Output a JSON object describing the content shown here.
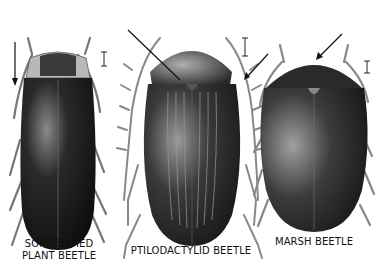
{
  "figure": {
    "background": "#ffffff",
    "ink_color": "#111111",
    "beetles": [
      {
        "id": "soft-bodied-plant-beetle",
        "label_line1": "SOFT-BODIED",
        "label_line2": "PLANT BEETLE",
        "scale_bar": "I",
        "arrow_pointing_to": "pronotum side"
      },
      {
        "id": "ptilodactylid-beetle",
        "label_line1": "PTILODACTYLID BEETLE",
        "scale_bar": "I",
        "arrow_pointing_to": "scutellum / antenna"
      },
      {
        "id": "marsh-beetle",
        "label_line1": "MARSH BEETLE",
        "scale_bar": "I",
        "arrow_pointing_to": "head"
      }
    ]
  }
}
